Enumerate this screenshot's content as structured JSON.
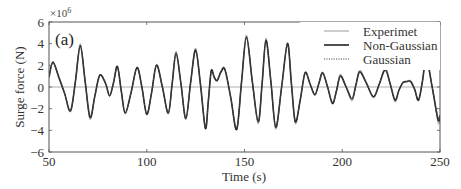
{
  "chart_data": {
    "type": "line",
    "title": "",
    "panel_label": "(a)",
    "xlabel": "Time (s)",
    "ylabel": "Surge force (N)",
    "y_multiplier": "×10",
    "y_exponent": "6",
    "xlim": [
      50,
      250
    ],
    "ylim": [
      -6,
      6
    ],
    "xticks": [
      50,
      100,
      150,
      200,
      250
    ],
    "yticks": [
      -6,
      -4,
      -2,
      0,
      2,
      4,
      6
    ],
    "zero_line": true,
    "grid": false,
    "legend_position": "upper right",
    "series": [
      {
        "name": "Experimet",
        "style": "solid-thin-light",
        "color": "#9a9a9a",
        "x": [
          50,
          52,
          55,
          58,
          61,
          63.5,
          66,
          68.5,
          71,
          73.5,
          76,
          79,
          81,
          83,
          85,
          87,
          89,
          92,
          95,
          97.5,
          100,
          102.5,
          105,
          108,
          111,
          113,
          115,
          117.5,
          120,
          122.5,
          125,
          127.5,
          130,
          131.5,
          133,
          134.5,
          136,
          138,
          140,
          143,
          146,
          148.5,
          151,
          154,
          157,
          159,
          161,
          163.5,
          166,
          169,
          172,
          174,
          176,
          178.5,
          181,
          183.5,
          186,
          188,
          190,
          192.5,
          195,
          197,
          199,
          202,
          205,
          207,
          209,
          212.5,
          216,
          219,
          222,
          224.5,
          227,
          229,
          231,
          233,
          235,
          237,
          239,
          241,
          243,
          246,
          249,
          250
        ],
        "y": [
          1.0,
          2.3,
          1.0,
          -0.6,
          -2.3,
          0.5,
          4.0,
          0.5,
          -3.0,
          -0.8,
          1.1,
          0.3,
          -0.9,
          0.4,
          1.9,
          -0.4,
          -2.5,
          -0.5,
          1.8,
          0.0,
          -2.6,
          -0.5,
          2.1,
          0.0,
          -2.5,
          0.3,
          3.3,
          0.3,
          -3.0,
          0.5,
          3.6,
          0.2,
          -3.9,
          -1.3,
          1.5,
          0.9,
          0.6,
          1.5,
          1.7,
          -1.0,
          -4.0,
          0.5,
          4.8,
          0.5,
          -3.4,
          0.3,
          4.5,
          0.5,
          -3.9,
          0.0,
          4.1,
          0.3,
          -3.4,
          -1.2,
          1.4,
          0.3,
          -0.8,
          0.3,
          1.4,
          0.0,
          -1.6,
          -0.4,
          1.2,
          0.0,
          -1.3,
          0.2,
          1.6,
          0.3,
          -1.0,
          0.3,
          1.8,
          0.3,
          -1.4,
          -0.3,
          0.4,
          0.5,
          0.6,
          -0.2,
          -1.3,
          0.5,
          3.0,
          0.0,
          -3.3,
          -2.8
        ]
      },
      {
        "name": "Non-Gaussian",
        "style": "solid-thick-dark",
        "color": "#222222",
        "x": [
          50,
          52,
          55,
          58,
          61,
          63.5,
          66,
          68.5,
          71,
          73.5,
          76,
          79,
          81,
          83,
          85,
          87,
          89,
          92,
          95,
          97.5,
          100,
          102.5,
          105,
          108,
          111,
          113,
          115,
          117.5,
          120,
          122.5,
          125,
          127.5,
          130,
          131.5,
          133,
          134.5,
          136,
          138,
          140,
          143,
          146,
          148.5,
          151,
          154,
          157,
          159,
          161,
          163.5,
          166,
          169,
          172,
          174,
          176,
          178.5,
          181,
          183.5,
          186,
          188,
          190,
          192.5,
          195,
          197,
          199,
          202,
          205,
          207,
          209,
          212.5,
          216,
          219,
          222,
          224.5,
          227,
          229,
          231,
          233,
          235,
          237,
          239,
          241,
          243,
          246,
          249,
          250
        ],
        "y": [
          0.9,
          2.3,
          0.9,
          -0.6,
          -2.2,
          0.5,
          3.8,
          0.5,
          -2.8,
          -0.8,
          1.1,
          0.3,
          -0.8,
          0.4,
          1.9,
          -0.4,
          -2.4,
          -0.5,
          1.8,
          0.0,
          -2.5,
          -0.5,
          2.0,
          0.0,
          -2.4,
          0.3,
          3.1,
          0.3,
          -2.9,
          0.5,
          3.4,
          0.2,
          -3.8,
          -1.3,
          1.5,
          0.9,
          0.6,
          1.4,
          1.6,
          -1.0,
          -3.9,
          0.5,
          4.6,
          0.5,
          -3.2,
          0.3,
          4.3,
          0.5,
          -3.7,
          0.0,
          4.0,
          0.3,
          -3.2,
          -1.2,
          1.3,
          0.3,
          -0.7,
          0.3,
          1.3,
          0.0,
          -1.5,
          -0.4,
          1.0,
          0.0,
          -1.1,
          0.2,
          1.4,
          0.3,
          -0.9,
          0.3,
          1.6,
          0.3,
          -1.2,
          -0.3,
          0.4,
          0.5,
          0.5,
          -0.2,
          -1.2,
          0.5,
          2.6,
          0.0,
          -3.0,
          -2.6
        ]
      },
      {
        "name": "Gaussian",
        "style": "dotted",
        "color": "#555555",
        "x": [
          50,
          52,
          55,
          58,
          61,
          63.5,
          66,
          68.5,
          71,
          73.5,
          76,
          79,
          81,
          83,
          85,
          87,
          89,
          92,
          95,
          97.5,
          100,
          102.5,
          105,
          108,
          111,
          113,
          115,
          117.5,
          120,
          122.5,
          125,
          127.5,
          130,
          131.5,
          133,
          134.5,
          136,
          138,
          140,
          143,
          146,
          148.5,
          151,
          154,
          157,
          159,
          161,
          163.5,
          166,
          169,
          172,
          174,
          176,
          178.5,
          181,
          183.5,
          186,
          188,
          190,
          192.5,
          195,
          197,
          199,
          202,
          205,
          207,
          209,
          212.5,
          216,
          219,
          222,
          224.5,
          227,
          229,
          231,
          233,
          235,
          237,
          239,
          241,
          243,
          246,
          249,
          250
        ],
        "y": [
          0.9,
          2.2,
          0.9,
          -0.6,
          -2.2,
          0.5,
          3.7,
          0.5,
          -2.8,
          -0.8,
          1.0,
          0.3,
          -0.8,
          0.4,
          1.8,
          -0.4,
          -2.4,
          -0.5,
          1.7,
          0.0,
          -2.5,
          -0.5,
          2.0,
          0.0,
          -2.4,
          0.3,
          3.0,
          0.3,
          -2.9,
          0.5,
          3.3,
          0.2,
          -3.7,
          -1.3,
          1.4,
          0.9,
          0.6,
          1.4,
          1.6,
          -1.0,
          -3.8,
          0.5,
          4.5,
          0.5,
          -3.2,
          0.3,
          4.2,
          0.5,
          -3.6,
          0.0,
          3.9,
          0.3,
          -3.1,
          -1.2,
          1.3,
          0.3,
          -0.7,
          0.3,
          1.3,
          0.0,
          -1.4,
          -0.4,
          1.0,
          0.0,
          -1.1,
          0.2,
          1.4,
          0.3,
          -0.9,
          0.3,
          1.5,
          0.3,
          -1.2,
          -0.3,
          0.4,
          0.5,
          0.5,
          -0.2,
          -1.1,
          0.5,
          2.5,
          0.0,
          -2.9,
          -2.5
        ]
      }
    ]
  }
}
